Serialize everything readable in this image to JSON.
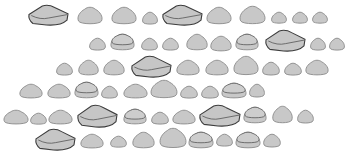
{
  "illustration": {
    "subject": "rows of gray pebbles",
    "background": "#ffffff",
    "colors": {
      "fill": "#c8c8c8",
      "outline": "#8a8a8a",
      "outline_dark": "#3c3c3c"
    },
    "rows": [
      {
        "stones": [
          {
            "x": 28,
            "y": 5,
            "w": 41,
            "h": 21,
            "type": "slab"
          },
          {
            "x": 77,
            "y": 7,
            "w": 26,
            "h": 18,
            "type": "round"
          },
          {
            "x": 111,
            "y": 7,
            "w": 26,
            "h": 18,
            "type": "round"
          },
          {
            "x": 142,
            "y": 12,
            "w": 16,
            "h": 13,
            "type": "round"
          },
          {
            "x": 162,
            "y": 5,
            "w": 41,
            "h": 21,
            "type": "slab"
          },
          {
            "x": 206,
            "y": 7,
            "w": 26,
            "h": 18,
            "type": "round"
          },
          {
            "x": 239,
            "y": 6,
            "w": 27,
            "h": 19,
            "type": "round"
          },
          {
            "x": 271,
            "y": 12,
            "w": 16,
            "h": 12,
            "type": "round"
          },
          {
            "x": 292,
            "y": 12,
            "w": 16,
            "h": 12,
            "type": "round"
          },
          {
            "x": 312,
            "y": 12,
            "w": 16,
            "h": 12,
            "type": "round"
          }
        ]
      },
      {
        "stones": [
          {
            "x": 89,
            "y": 38,
            "w": 17,
            "h": 13,
            "type": "round"
          },
          {
            "x": 110,
            "y": 34,
            "w": 25,
            "h": 17,
            "type": "layered"
          },
          {
            "x": 141,
            "y": 38,
            "w": 17,
            "h": 13,
            "type": "round"
          },
          {
            "x": 162,
            "y": 38,
            "w": 17,
            "h": 13,
            "type": "round"
          },
          {
            "x": 186,
            "y": 34,
            "w": 22,
            "h": 17,
            "type": "round"
          },
          {
            "x": 210,
            "y": 36,
            "w": 22,
            "h": 16,
            "type": "round"
          },
          {
            "x": 235,
            "y": 34,
            "w": 24,
            "h": 17,
            "type": "layered"
          },
          {
            "x": 265,
            "y": 30,
            "w": 41,
            "h": 22,
            "type": "slab"
          },
          {
            "x": 310,
            "y": 38,
            "w": 16,
            "h": 13,
            "type": "round"
          },
          {
            "x": 329,
            "y": 38,
            "w": 16,
            "h": 13,
            "type": "round"
          }
        ]
      },
      {
        "stones": [
          {
            "x": 56,
            "y": 63,
            "w": 17,
            "h": 13,
            "type": "round"
          },
          {
            "x": 78,
            "y": 60,
            "w": 21,
            "h": 16,
            "type": "round"
          },
          {
            "x": 103,
            "y": 60,
            "w": 22,
            "h": 16,
            "type": "round"
          },
          {
            "x": 131,
            "y": 56,
            "w": 41,
            "h": 22,
            "type": "slab"
          },
          {
            "x": 176,
            "y": 60,
            "w": 24,
            "h": 16,
            "type": "round"
          },
          {
            "x": 205,
            "y": 60,
            "w": 24,
            "h": 16,
            "type": "round"
          },
          {
            "x": 233,
            "y": 56,
            "w": 26,
            "h": 20,
            "type": "round"
          },
          {
            "x": 262,
            "y": 62,
            "w": 18,
            "h": 14,
            "type": "round"
          },
          {
            "x": 284,
            "y": 63,
            "w": 18,
            "h": 13,
            "type": "round"
          },
          {
            "x": 305,
            "y": 60,
            "w": 24,
            "h": 16,
            "type": "round"
          }
        ]
      },
      {
        "stones": [
          {
            "x": 19,
            "y": 84,
            "w": 24,
            "h": 15,
            "type": "round"
          },
          {
            "x": 47,
            "y": 84,
            "w": 24,
            "h": 15,
            "type": "round"
          },
          {
            "x": 74,
            "y": 82,
            "w": 25,
            "h": 17,
            "type": "layered"
          },
          {
            "x": 101,
            "y": 86,
            "w": 17,
            "h": 13,
            "type": "round"
          },
          {
            "x": 123,
            "y": 84,
            "w": 25,
            "h": 15,
            "type": "round"
          },
          {
            "x": 150,
            "y": 80,
            "w": 28,
            "h": 19,
            "type": "round"
          },
          {
            "x": 180,
            "y": 86,
            "w": 18,
            "h": 13,
            "type": "round"
          },
          {
            "x": 201,
            "y": 86,
            "w": 18,
            "h": 13,
            "type": "round"
          },
          {
            "x": 221,
            "y": 83,
            "w": 26,
            "h": 16,
            "type": "layered"
          },
          {
            "x": 249,
            "y": 84,
            "w": 16,
            "h": 14,
            "type": "round"
          }
        ]
      },
      {
        "stones": [
          {
            "x": 3,
            "y": 110,
            "w": 26,
            "h": 15,
            "type": "round"
          },
          {
            "x": 30,
            "y": 113,
            "w": 17,
            "h": 12,
            "type": "round"
          },
          {
            "x": 48,
            "y": 110,
            "w": 25,
            "h": 15,
            "type": "round"
          },
          {
            "x": 77,
            "y": 105,
            "w": 41,
            "h": 23,
            "type": "slab"
          },
          {
            "x": 123,
            "y": 109,
            "w": 24,
            "h": 16,
            "type": "layered"
          },
          {
            "x": 151,
            "y": 112,
            "w": 18,
            "h": 13,
            "type": "round"
          },
          {
            "x": 172,
            "y": 110,
            "w": 24,
            "h": 15,
            "type": "round"
          },
          {
            "x": 199,
            "y": 105,
            "w": 42,
            "h": 22,
            "type": "slab"
          },
          {
            "x": 243,
            "y": 107,
            "w": 24,
            "h": 17,
            "type": "layered"
          },
          {
            "x": 272,
            "y": 106,
            "w": 21,
            "h": 18,
            "type": "round"
          },
          {
            "x": 297,
            "y": 110,
            "w": 17,
            "h": 14,
            "type": "round"
          }
        ]
      },
      {
        "stones": [
          {
            "x": 35,
            "y": 129,
            "w": 41,
            "h": 22,
            "type": "slab"
          },
          {
            "x": 80,
            "y": 134,
            "w": 24,
            "h": 15,
            "type": "round"
          },
          {
            "x": 110,
            "y": 136,
            "w": 17,
            "h": 12,
            "type": "round"
          },
          {
            "x": 132,
            "y": 132,
            "w": 23,
            "h": 17,
            "type": "round"
          },
          {
            "x": 159,
            "y": 128,
            "w": 28,
            "h": 21,
            "type": "round"
          },
          {
            "x": 188,
            "y": 132,
            "w": 26,
            "h": 17,
            "type": "layered"
          },
          {
            "x": 216,
            "y": 134,
            "w": 17,
            "h": 13,
            "type": "round"
          },
          {
            "x": 235,
            "y": 132,
            "w": 26,
            "h": 17,
            "type": "layered"
          },
          {
            "x": 263,
            "y": 134,
            "w": 18,
            "h": 14,
            "type": "round"
          }
        ]
      }
    ]
  }
}
